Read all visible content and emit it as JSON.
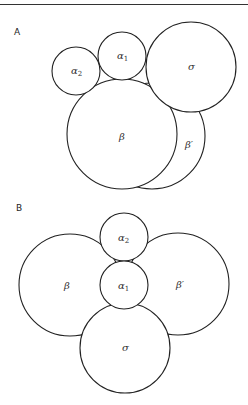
{
  "panels": [
    {
      "label": "A",
      "circles": {
        "beta_prime": {
          "label": "β",
          "prime": "′",
          "cx": 152,
          "cy": 136,
          "r": 53,
          "lx": 185,
          "ly": 148
        },
        "beta": {
          "label": "β",
          "cx": 122,
          "cy": 134,
          "r": 55,
          "lx": 120,
          "ly": 140
        },
        "alpha2": {
          "label": "α",
          "sub": "2",
          "cx": 76,
          "cy": 71,
          "r": 24,
          "lx": 72,
          "ly": 74
        },
        "alpha1": {
          "label": "α",
          "sub": "1",
          "cx": 122,
          "cy": 56,
          "r": 24,
          "lx": 118,
          "ly": 59
        },
        "sigma": {
          "label": "σ",
          "cx": 191,
          "cy": 67,
          "r": 45,
          "lx": 188,
          "ly": 70
        }
      }
    },
    {
      "label": "B",
      "circles": {
        "beta": {
          "label": "β",
          "cx": 70,
          "cy": 285,
          "r": 51,
          "lx": 65,
          "ly": 289
        },
        "beta_prime": {
          "label": "β",
          "prime": "′",
          "cx": 178,
          "cy": 284,
          "r": 51,
          "lx": 177,
          "ly": 288
        },
        "sigma": {
          "label": "σ",
          "cx": 125,
          "cy": 348,
          "r": 45,
          "lx": 122,
          "ly": 351
        },
        "alpha2": {
          "label": "α",
          "sub": "2",
          "cx": 124,
          "cy": 237,
          "r": 24,
          "lx": 119,
          "ly": 241
        },
        "alpha1": {
          "label": "α",
          "sub": "1",
          "cx": 124,
          "cy": 285,
          "r": 24,
          "lx": 119,
          "ly": 289
        }
      }
    }
  ]
}
